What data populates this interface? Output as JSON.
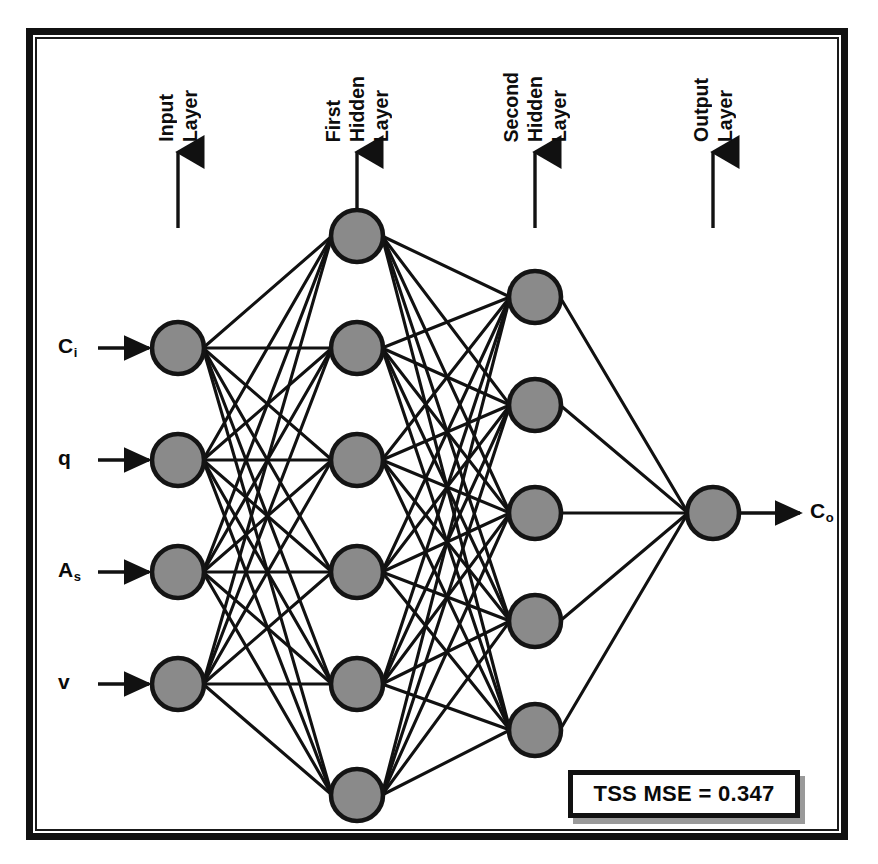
{
  "diagram": {
    "node_fill_color": "#8a8a8a",
    "node_stroke_color": "#141414",
    "edge_color": "#111111",
    "frame_color": "#111111",
    "background_color": "#ffffff"
  },
  "layer_captions": [
    {
      "id": "input",
      "lines": [
        "Input",
        "Layer"
      ],
      "arrow_x": 178
    },
    {
      "id": "first-hidden",
      "lines": [
        "First",
        "Hidden",
        "Layer"
      ],
      "arrow_x": 357
    },
    {
      "id": "second-hidden",
      "lines": [
        "Second",
        "Hidden",
        "Layer"
      ],
      "arrow_x": 535
    },
    {
      "id": "output",
      "lines": [
        "Output",
        "Layer"
      ],
      "arrow_x": 713
    }
  ],
  "layers": [
    {
      "id": "input-layer",
      "name": "Input Layer",
      "x": 178,
      "node_count": 4,
      "node_ys": [
        348,
        460,
        572,
        684
      ],
      "radius": 26
    },
    {
      "id": "first-hidden-layer",
      "name": "First Hidden Layer",
      "x": 357,
      "node_count": 6,
      "node_ys": [
        236,
        348,
        460,
        572,
        684,
        795
      ],
      "radius": 26
    },
    {
      "id": "second-hidden-layer",
      "name": "Second Hidden Layer",
      "x": 535,
      "node_count": 5,
      "node_ys": [
        297,
        405,
        513,
        621,
        730
      ],
      "radius": 26
    },
    {
      "id": "output-layer",
      "name": "Output Layer",
      "x": 713,
      "node_count": 1,
      "node_ys": [
        513
      ],
      "radius": 26
    }
  ],
  "inputs": [
    {
      "symbol": "C",
      "subscript": "i",
      "label": "Ci",
      "y": 348
    },
    {
      "symbol": "q",
      "subscript": "",
      "label": "q",
      "y": 460
    },
    {
      "symbol": "A",
      "subscript": "s",
      "label": "As",
      "y": 572
    },
    {
      "symbol": "v",
      "subscript": "",
      "label": "v",
      "y": 684
    }
  ],
  "outputs": [
    {
      "symbol": "C",
      "subscript": "o",
      "label": "Co",
      "y": 513
    }
  ],
  "annotation": {
    "mse_label": "TSS MSE = 0.347",
    "metric_name": "TSS MSE",
    "metric_value": "0.347"
  },
  "chart_data": {
    "type": "diagram",
    "subtype": "neural-network",
    "architecture": "4-6-5-1",
    "layer_sizes": [
      4,
      6,
      5,
      1
    ],
    "layer_names": [
      "Input Layer",
      "First Hidden Layer",
      "Second Hidden Layer",
      "Output Layer"
    ],
    "input_variables": [
      "Ci",
      "q",
      "As",
      "v"
    ],
    "output_variables": [
      "Co"
    ],
    "fully_connected": true,
    "connection_counts": [
      24,
      30,
      5
    ],
    "total_connections": 59,
    "annotations": [
      "TSS MSE = 0.347"
    ]
  }
}
